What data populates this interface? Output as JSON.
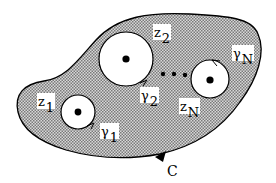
{
  "diagram": {
    "colors": {
      "fill": "#b8b8b8",
      "stroke": "#000000",
      "hole": "#ffffff"
    },
    "outer_contour": {
      "label": "C",
      "orientation": "counterclockwise arrow at bottom"
    },
    "holes": [
      {
        "id": "z1",
        "point_label": "z",
        "point_sub": "1",
        "curve_label": "γ",
        "curve_sub": "1"
      },
      {
        "id": "z2",
        "point_label": "z",
        "point_sub": "2",
        "curve_label": "γ",
        "curve_sub": "2"
      },
      {
        "id": "zN",
        "point_label": "z",
        "point_sub": "N",
        "curve_label": "γ",
        "curve_sub": "N"
      }
    ],
    "ellipsis": "• • •"
  }
}
